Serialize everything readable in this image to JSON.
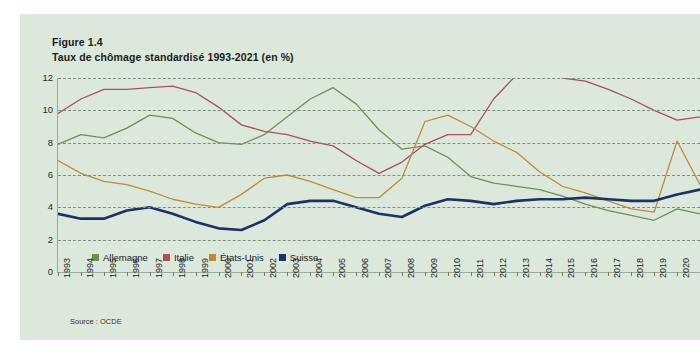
{
  "card": {
    "bg_color": "#dde8dc"
  },
  "figure": {
    "label": "Figure 1.4",
    "title": "Taux de chômage standardisé 1993-2021 (en %)",
    "source": "Source : OCDE"
  },
  "legend": {
    "items": [
      {
        "label": "Allemagne",
        "color": "#6d9153"
      },
      {
        "label": "Italie",
        "color": "#a94e5e"
      },
      {
        "label": "États-Unis",
        "color": "#c08a3e"
      },
      {
        "label": "Suisse",
        "color": "#1b3263"
      }
    ]
  },
  "chart_data": {
    "type": "line",
    "title": "Taux de chômage standardisé 1993-2021 (en %)",
    "xlabel": "",
    "ylabel": "",
    "ylim": [
      0,
      12
    ],
    "yticks": [
      0,
      2,
      4,
      6,
      8,
      10,
      12
    ],
    "grid": true,
    "legend_position": "bottom-left",
    "x": [
      1993,
      1994,
      1995,
      1996,
      1997,
      1998,
      1999,
      2000,
      2001,
      2002,
      2003,
      2004,
      2005,
      2006,
      2007,
      2008,
      2009,
      2010,
      2011,
      2012,
      2013,
      2014,
      2015,
      2016,
      2017,
      2018,
      2019,
      2020,
      2021
    ],
    "xtick_labels": [
      "1993",
      "1994",
      "1995",
      "1996",
      "1997",
      "1998",
      "1999",
      "2000",
      "2001",
      "2002",
      "2003",
      "2004",
      "2005",
      "2006",
      "2007",
      "2008",
      "2009",
      "2010",
      "2011",
      "2012",
      "2013",
      "2014",
      "2015",
      "2016",
      "2017",
      "2018",
      "2019",
      "2020"
    ],
    "series": [
      {
        "name": "Allemagne",
        "color": "#6d9153",
        "values": [
          7.9,
          8.5,
          8.3,
          8.9,
          9.7,
          9.5,
          8.6,
          8.0,
          7.9,
          8.5,
          9.6,
          10.7,
          11.4,
          10.4,
          8.8,
          7.6,
          7.8,
          7.1,
          5.9,
          5.5,
          5.3,
          5.1,
          4.7,
          4.2,
          3.8,
          3.5,
          3.2,
          3.9,
          3.6
        ]
      },
      {
        "name": "Italie",
        "color": "#a94e5e",
        "values": [
          9.8,
          10.7,
          11.3,
          11.3,
          11.4,
          11.5,
          11.1,
          10.2,
          9.1,
          8.7,
          8.5,
          8.1,
          7.8,
          6.9,
          6.1,
          6.8,
          7.9,
          8.5,
          8.5,
          10.7,
          12.2,
          12.8,
          12.0,
          11.8,
          11.3,
          10.7,
          10.0,
          9.4,
          9.6
        ]
      },
      {
        "name": "États-Unis",
        "color": "#c08a3e",
        "values": [
          6.9,
          6.1,
          5.6,
          5.4,
          5.0,
          4.5,
          4.2,
          4.0,
          4.8,
          5.8,
          6.0,
          5.6,
          5.1,
          4.6,
          4.6,
          5.8,
          9.3,
          9.7,
          9.0,
          8.1,
          7.4,
          6.2,
          5.3,
          4.9,
          4.4,
          3.9,
          3.7,
          8.1,
          5.4
        ]
      },
      {
        "name": "Suisse",
        "color": "#1b3263",
        "values": [
          3.6,
          3.3,
          3.3,
          3.8,
          4.0,
          3.6,
          3.1,
          2.7,
          2.6,
          3.2,
          4.2,
          4.4,
          4.4,
          4.0,
          3.6,
          3.4,
          4.1,
          4.5,
          4.4,
          4.2,
          4.4,
          4.5,
          4.5,
          4.6,
          4.5,
          4.4,
          4.4,
          4.8,
          5.1
        ]
      }
    ]
  }
}
